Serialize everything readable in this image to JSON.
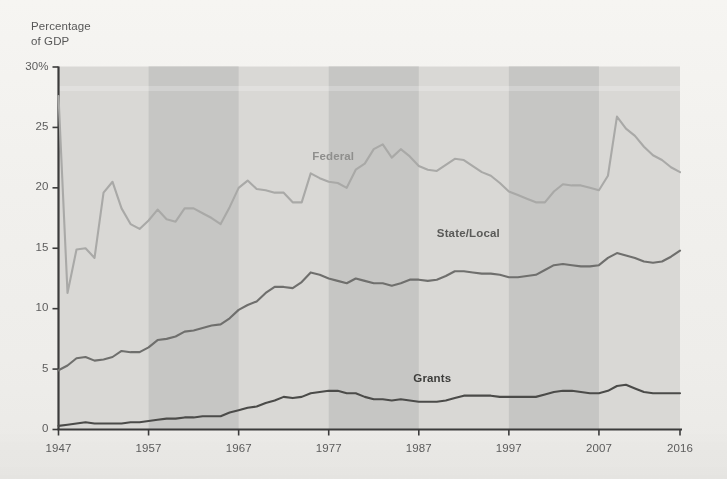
{
  "chart_data": {
    "type": "line",
    "title": "",
    "subtitle": "",
    "ylabel": "Percentage\nof GDP",
    "xlabel": "",
    "ylim": [
      0,
      30
    ],
    "xlim": [
      1947,
      2016
    ],
    "grid": false,
    "legend_position": "inline-labels",
    "y_ticks": [
      {
        "value": 30,
        "label": "30%"
      },
      {
        "value": 25,
        "label": "25"
      },
      {
        "value": 20,
        "label": "20"
      },
      {
        "value": 15,
        "label": "15"
      },
      {
        "value": 10,
        "label": "10"
      },
      {
        "value": 5,
        "label": "5"
      },
      {
        "value": 0,
        "label": "0"
      }
    ],
    "x_ticks": [
      {
        "value": 1947,
        "label": "1947"
      },
      {
        "value": 1957,
        "label": "1957"
      },
      {
        "value": 1967,
        "label": "1967"
      },
      {
        "value": 1977,
        "label": "1977"
      },
      {
        "value": 1987,
        "label": "1987"
      },
      {
        "value": 1997,
        "label": "1997"
      },
      {
        "value": 2007,
        "label": "2007"
      },
      {
        "value": 2016,
        "label": "2016"
      }
    ],
    "shaded_bands": [
      {
        "start": 1957,
        "end": 1967
      },
      {
        "start": 1977,
        "end": 1987
      },
      {
        "start": 1997,
        "end": 2007
      }
    ],
    "band_color": "#c6c6c4",
    "plot_bg_color": "#d9d8d5",
    "x": [
      1947,
      1948,
      1949,
      1950,
      1951,
      1952,
      1953,
      1954,
      1955,
      1956,
      1957,
      1958,
      1959,
      1960,
      1961,
      1962,
      1963,
      1964,
      1965,
      1966,
      1967,
      1968,
      1969,
      1970,
      1971,
      1972,
      1973,
      1974,
      1975,
      1976,
      1977,
      1978,
      1979,
      1980,
      1981,
      1982,
      1983,
      1984,
      1985,
      1986,
      1987,
      1988,
      1989,
      1990,
      1991,
      1992,
      1993,
      1994,
      1995,
      1996,
      1997,
      1998,
      1999,
      2000,
      2001,
      2002,
      2003,
      2004,
      2005,
      2006,
      2007,
      2008,
      2009,
      2010,
      2011,
      2012,
      2013,
      2014,
      2015,
      2016
    ],
    "series": [
      {
        "name": "Federal",
        "color": "#a9a9a7",
        "label_color": "#8f8f8d",
        "label_x": 1977.5,
        "label_y": 22.5,
        "values": [
          27.6,
          11.3,
          14.9,
          15.0,
          14.2,
          19.6,
          20.5,
          18.3,
          17.0,
          16.6,
          17.3,
          18.2,
          17.4,
          17.2,
          18.3,
          18.3,
          17.9,
          17.5,
          17.0,
          18.4,
          20.0,
          20.6,
          19.9,
          19.8,
          19.6,
          19.6,
          18.8,
          18.8,
          21.2,
          20.8,
          20.5,
          20.4,
          20.0,
          21.5,
          22.0,
          23.2,
          23.6,
          22.5,
          23.2,
          22.6,
          21.8,
          21.5,
          21.4,
          21.9,
          22.4,
          22.3,
          21.8,
          21.3,
          21.0,
          20.4,
          19.7,
          19.4,
          19.1,
          18.8,
          18.8,
          19.7,
          20.3,
          20.2,
          20.2,
          20.0,
          19.8,
          21.0,
          25.9,
          24.9,
          24.3,
          23.4,
          22.7,
          22.3,
          21.7,
          21.3
        ]
      },
      {
        "name": "State/Local",
        "color": "#6f6f6d",
        "label_color": "#5a5a58",
        "label_x": 1992.5,
        "label_y": 16.1,
        "values": [
          4.9,
          5.3,
          5.9,
          6.0,
          5.7,
          5.8,
          6.0,
          6.5,
          6.4,
          6.4,
          6.8,
          7.4,
          7.5,
          7.7,
          8.1,
          8.2,
          8.4,
          8.6,
          8.7,
          9.2,
          9.9,
          10.3,
          10.6,
          11.3,
          11.8,
          11.8,
          11.7,
          12.2,
          13.0,
          12.8,
          12.5,
          12.3,
          12.1,
          12.5,
          12.3,
          12.1,
          12.1,
          11.9,
          12.1,
          12.4,
          12.4,
          12.3,
          12.4,
          12.7,
          13.1,
          13.1,
          13.0,
          12.9,
          12.9,
          12.8,
          12.6,
          12.6,
          12.7,
          12.8,
          13.2,
          13.6,
          13.7,
          13.6,
          13.5,
          13.5,
          13.6,
          14.2,
          14.6,
          14.4,
          14.2,
          13.9,
          13.8,
          13.9,
          14.3,
          14.8
        ]
      },
      {
        "name": "Grants",
        "color": "#4b4b49",
        "label_color": "#3d3d3b",
        "label_x": 1988.5,
        "label_y": 4.1,
        "values": [
          0.3,
          0.4,
          0.5,
          0.6,
          0.5,
          0.5,
          0.5,
          0.5,
          0.6,
          0.6,
          0.7,
          0.8,
          0.9,
          0.9,
          1.0,
          1.0,
          1.1,
          1.1,
          1.1,
          1.4,
          1.6,
          1.8,
          1.9,
          2.2,
          2.4,
          2.7,
          2.6,
          2.7,
          3.0,
          3.1,
          3.2,
          3.2,
          3.0,
          3.0,
          2.7,
          2.5,
          2.5,
          2.4,
          2.5,
          2.4,
          2.3,
          2.3,
          2.3,
          2.4,
          2.6,
          2.8,
          2.8,
          2.8,
          2.8,
          2.7,
          2.7,
          2.7,
          2.7,
          2.7,
          2.9,
          3.1,
          3.2,
          3.2,
          3.1,
          3.0,
          3.0,
          3.2,
          3.6,
          3.7,
          3.4,
          3.1,
          3.0,
          3.0,
          3.0,
          3.0
        ]
      }
    ]
  }
}
